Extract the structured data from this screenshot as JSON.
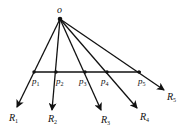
{
  "diagram": {
    "origin": {
      "label": "o",
      "x": 60,
      "y": 19
    },
    "segment": {
      "x1": 33,
      "y1": 72,
      "x2": 141,
      "y2": 72
    },
    "points": [
      {
        "label": "p",
        "sub": "1",
        "x": 34,
        "y": 72
      },
      {
        "label": "p",
        "sub": "2",
        "x": 56,
        "y": 72
      },
      {
        "label": "p",
        "sub": "3",
        "x": 85,
        "y": 72
      },
      {
        "label": "p",
        "sub": "4",
        "x": 107,
        "y": 72
      },
      {
        "label": "p",
        "sub": "5",
        "x": 139,
        "y": 72
      }
    ],
    "rays": [
      {
        "label": "R",
        "sub": "1",
        "tip_x": 17,
        "tip_y": 107
      },
      {
        "label": "R",
        "sub": "2",
        "tip_x": 52,
        "tip_y": 110
      },
      {
        "label": "R",
        "sub": "3",
        "tip_x": 101,
        "tip_y": 110
      },
      {
        "label": "R",
        "sub": "4",
        "tip_x": 137,
        "tip_y": 108
      },
      {
        "label": "R",
        "sub": "5",
        "tip_x": 164,
        "tip_y": 90
      }
    ],
    "color": "#111111"
  }
}
